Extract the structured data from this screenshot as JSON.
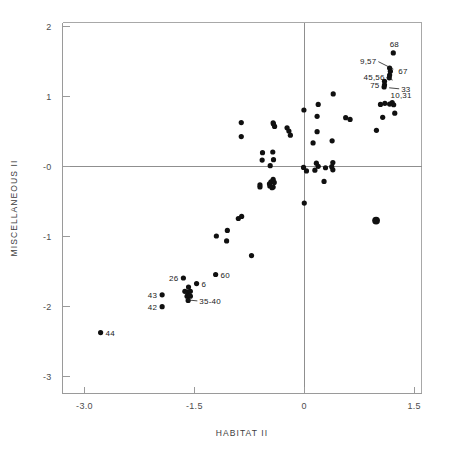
{
  "chart_data": {
    "type": "scatter",
    "title": "",
    "xlabel": "HABITAT  II",
    "ylabel": "MISCELLANEOUS  II",
    "xlim": [
      -3.3,
      1.6
    ],
    "ylim": [
      -3.25,
      2.05
    ],
    "xticks": [
      "-3.0",
      "-1.5",
      "0",
      "1.5"
    ],
    "xtick_values": [
      -3.0,
      -1.5,
      0,
      1.5
    ],
    "yticks": [
      "2",
      "1",
      "-0",
      "-1",
      "-2",
      "-3"
    ],
    "ytick_values": [
      2,
      1,
      0,
      -1,
      -2,
      -3
    ],
    "grid": false,
    "legend": "none",
    "zero_lines": {
      "x": 0,
      "y": 0
    },
    "marker_color": "#101010",
    "axis_color": "#9a9a9a",
    "points": [
      {
        "x": -2.78,
        "y": -2.38,
        "label": "44",
        "label_pos": "right",
        "size": 2.6
      },
      {
        "x": -1.94,
        "y": -1.84,
        "label": "43",
        "label_pos": "left",
        "size": 2.6
      },
      {
        "x": -1.94,
        "y": -2.01,
        "label": "42",
        "label_pos": "left",
        "size": 2.6
      },
      {
        "x": -1.65,
        "y": -1.6,
        "label": "26",
        "label_pos": "left",
        "size": 2.6
      },
      {
        "x": -1.47,
        "y": -1.68,
        "label": "6",
        "label_pos": "right",
        "size": 2.6
      },
      {
        "x": -1.21,
        "y": -1.55,
        "label": "60",
        "label_pos": "right",
        "size": 2.6
      },
      {
        "x": -1.58,
        "y": -1.73,
        "label": "",
        "label_pos": "",
        "size": 2.6
      },
      {
        "x": -1.63,
        "y": -1.79,
        "label": "",
        "label_pos": "",
        "size": 2.6
      },
      {
        "x": -1.59,
        "y": -1.8,
        "label": "",
        "label_pos": "",
        "size": 2.6
      },
      {
        "x": -1.555,
        "y": -1.79,
        "label": "",
        "label_pos": "",
        "size": 2.6
      },
      {
        "x": -1.6,
        "y": -1.86,
        "label": "",
        "label_pos": "",
        "size": 2.6
      },
      {
        "x": -1.555,
        "y": -1.86,
        "label": "",
        "label_pos": "",
        "size": 2.6
      },
      {
        "x": -1.585,
        "y": -1.92,
        "label": "",
        "label_pos": "",
        "size": 2.6
      },
      {
        "x": -0.72,
        "y": -1.28,
        "label": "",
        "label_pos": "",
        "size": 2.6
      },
      {
        "x": -1.2,
        "y": -1.0,
        "label": "",
        "label_pos": "",
        "size": 2.6
      },
      {
        "x": -1.05,
        "y": -0.92,
        "label": "",
        "label_pos": "",
        "size": 2.6
      },
      {
        "x": -1.06,
        "y": -1.07,
        "label": "",
        "label_pos": "",
        "size": 2.6
      },
      {
        "x": -0.9,
        "y": -0.75,
        "label": "",
        "label_pos": "",
        "size": 2.6
      },
      {
        "x": -0.855,
        "y": -0.72,
        "label": "",
        "label_pos": "",
        "size": 2.6
      },
      {
        "x": 0.0,
        "y": -0.53,
        "label": "",
        "label_pos": "",
        "size": 2.6
      },
      {
        "x": 0.98,
        "y": -0.78,
        "label": "",
        "label_pos": "",
        "size": 3.9
      },
      {
        "x": -0.605,
        "y": -0.27,
        "label": "",
        "label_pos": "",
        "size": 2.6
      },
      {
        "x": -0.605,
        "y": -0.3,
        "label": "",
        "label_pos": "",
        "size": 2.6
      },
      {
        "x": -0.475,
        "y": -0.255,
        "label": "",
        "label_pos": "",
        "size": 2.6
      },
      {
        "x": -0.47,
        "y": -0.285,
        "label": "",
        "label_pos": "",
        "size": 2.6
      },
      {
        "x": -0.455,
        "y": -0.225,
        "label": "",
        "label_pos": "",
        "size": 2.6
      },
      {
        "x": -0.44,
        "y": -0.31,
        "label": "",
        "label_pos": "",
        "size": 2.6
      },
      {
        "x": -0.425,
        "y": -0.19,
        "label": "",
        "label_pos": "",
        "size": 2.6
      },
      {
        "x": -0.41,
        "y": -0.235,
        "label": "",
        "label_pos": "",
        "size": 2.6
      },
      {
        "x": -0.425,
        "y": -0.3,
        "label": "",
        "label_pos": "",
        "size": 2.6
      },
      {
        "x": -0.465,
        "y": 0.005,
        "label": "",
        "label_pos": "",
        "size": 2.6
      },
      {
        "x": -0.575,
        "y": 0.085,
        "label": "",
        "label_pos": "",
        "size": 2.6
      },
      {
        "x": -0.42,
        "y": 0.09,
        "label": "",
        "label_pos": "",
        "size": 2.6
      },
      {
        "x": -0.57,
        "y": 0.19,
        "label": "",
        "label_pos": "",
        "size": 2.6
      },
      {
        "x": -0.43,
        "y": 0.2,
        "label": "",
        "label_pos": "",
        "size": 2.6
      },
      {
        "x": -0.42,
        "y": 0.6,
        "label": "",
        "label_pos": "",
        "size": 2.6
      },
      {
        "x": -0.405,
        "y": 0.565,
        "label": "",
        "label_pos": "",
        "size": 2.6
      },
      {
        "x": -0.425,
        "y": 0.615,
        "label": "",
        "label_pos": "",
        "size": 2.6
      },
      {
        "x": -0.86,
        "y": 0.62,
        "label": "",
        "label_pos": "",
        "size": 2.6
      },
      {
        "x": -0.86,
        "y": 0.42,
        "label": "",
        "label_pos": "",
        "size": 2.6
      },
      {
        "x": -0.235,
        "y": 0.545,
        "label": "",
        "label_pos": "",
        "size": 2.6
      },
      {
        "x": -0.21,
        "y": 0.5,
        "label": "",
        "label_pos": "",
        "size": 2.6
      },
      {
        "x": -0.19,
        "y": 0.44,
        "label": "",
        "label_pos": "",
        "size": 2.6
      },
      {
        "x": -0.005,
        "y": 0.8,
        "label": "",
        "label_pos": "",
        "size": 2.6
      },
      {
        "x": -0.01,
        "y": -0.02,
        "label": "",
        "label_pos": "",
        "size": 2.6
      },
      {
        "x": 0.03,
        "y": -0.07,
        "label": "",
        "label_pos": "",
        "size": 2.6
      },
      {
        "x": 0.12,
        "y": 0.33,
        "label": "",
        "label_pos": "",
        "size": 2.6
      },
      {
        "x": 0.19,
        "y": 0.88,
        "label": "",
        "label_pos": "",
        "size": 2.6
      },
      {
        "x": 0.175,
        "y": 0.71,
        "label": "",
        "label_pos": "",
        "size": 2.6
      },
      {
        "x": 0.175,
        "y": 0.49,
        "label": "",
        "label_pos": "",
        "size": 2.6
      },
      {
        "x": 0.165,
        "y": 0.04,
        "label": "",
        "label_pos": "",
        "size": 2.6
      },
      {
        "x": 0.19,
        "y": -0.005,
        "label": "",
        "label_pos": "",
        "size": 2.6
      },
      {
        "x": 0.145,
        "y": -0.06,
        "label": "",
        "label_pos": "",
        "size": 2.6
      },
      {
        "x": 0.27,
        "y": -0.22,
        "label": "",
        "label_pos": "",
        "size": 2.6
      },
      {
        "x": 0.29,
        "y": -0.025,
        "label": "",
        "label_pos": "",
        "size": 2.6
      },
      {
        "x": 0.395,
        "y": 1.03,
        "label": "",
        "label_pos": "",
        "size": 2.6
      },
      {
        "x": 0.38,
        "y": 0.36,
        "label": "",
        "label_pos": "",
        "size": 2.6
      },
      {
        "x": 0.39,
        "y": 0.05,
        "label": "",
        "label_pos": "",
        "size": 2.6
      },
      {
        "x": 0.375,
        "y": -0.01,
        "label": "",
        "label_pos": "",
        "size": 2.6
      },
      {
        "x": 0.39,
        "y": -0.055,
        "label": "",
        "label_pos": "",
        "size": 2.6
      },
      {
        "x": 0.565,
        "y": 0.69,
        "label": "",
        "label_pos": "",
        "size": 2.6
      },
      {
        "x": 0.625,
        "y": 0.665,
        "label": "",
        "label_pos": "",
        "size": 2.6
      },
      {
        "x": 0.985,
        "y": 0.51,
        "label": "",
        "label_pos": "",
        "size": 2.6
      },
      {
        "x": 1.04,
        "y": 0.88,
        "label": "",
        "label_pos": "",
        "size": 2.6
      },
      {
        "x": 1.07,
        "y": 0.695,
        "label": "",
        "label_pos": "",
        "size": 2.6
      },
      {
        "x": 1.1,
        "y": 0.895,
        "label": "",
        "label_pos": "",
        "size": 2.6
      },
      {
        "x": 1.165,
        "y": 0.885,
        "label": "",
        "label_pos": "",
        "size": 2.6
      },
      {
        "x": 1.2,
        "y": 0.905,
        "label": "",
        "label_pos": "",
        "size": 2.6
      },
      {
        "x": 1.22,
        "y": 0.875,
        "label": "",
        "label_pos": "",
        "size": 2.6
      },
      {
        "x": 1.235,
        "y": 0.755,
        "label": "",
        "label_pos": "",
        "size": 2.6
      },
      {
        "x": 1.09,
        "y": 1.13,
        "label": "",
        "label_pos": "",
        "size": 2.6
      },
      {
        "x": 1.095,
        "y": 1.16,
        "label": "",
        "label_pos": "",
        "size": 2.6
      },
      {
        "x": 1.095,
        "y": 1.21,
        "label": "",
        "label_pos": "",
        "size": 2.6
      },
      {
        "x": 1.16,
        "y": 1.26,
        "label": "",
        "label_pos": "",
        "size": 2.6
      },
      {
        "x": 1.165,
        "y": 1.3,
        "label": "",
        "label_pos": "",
        "size": 2.6
      },
      {
        "x": 1.175,
        "y": 1.355,
        "label": "",
        "label_pos": "",
        "size": 2.6
      },
      {
        "x": 1.165,
        "y": 1.4,
        "label": "",
        "label_pos": "",
        "size": 2.6
      },
      {
        "x": 1.215,
        "y": 1.615,
        "label": "",
        "label_pos": "",
        "size": 2.6
      }
    ],
    "callout_labels": [
      {
        "text": "68",
        "x": 1.215,
        "y": 1.615,
        "anchor": "above-right",
        "leader": false
      },
      {
        "text": "9,57",
        "x": 1.175,
        "y": 1.355,
        "anchor": "upper-left",
        "leader": true
      },
      {
        "text": "67",
        "x": 1.215,
        "y": 1.36,
        "anchor": "right",
        "leader": false
      },
      {
        "text": "45,56",
        "x": 1.165,
        "y": 1.27,
        "anchor": "left",
        "leader": true
      },
      {
        "text": "33",
        "x": 1.2,
        "y": 1.16,
        "anchor": "lower-right",
        "leader": true
      },
      {
        "text": "75",
        "x": 1.095,
        "y": 1.16,
        "anchor": "left",
        "leader": false
      },
      {
        "text": "10,31",
        "x": 1.11,
        "y": 1.02,
        "anchor": "right",
        "leader": false
      },
      {
        "text": "26",
        "x": -1.65,
        "y": -1.6,
        "anchor": "left",
        "leader": false
      },
      {
        "text": "6",
        "x": -1.47,
        "y": -1.68,
        "anchor": "right",
        "leader": false
      },
      {
        "text": "60",
        "x": -1.21,
        "y": -1.55,
        "anchor": "right",
        "leader": false
      },
      {
        "text": "43",
        "x": -1.94,
        "y": -1.84,
        "anchor": "left",
        "leader": false
      },
      {
        "text": "42",
        "x": -1.94,
        "y": -2.01,
        "anchor": "left",
        "leader": false
      },
      {
        "text": "35-40",
        "x": -1.555,
        "y": -1.87,
        "anchor": "lower-right",
        "leader": true
      },
      {
        "text": "44",
        "x": -2.78,
        "y": -2.38,
        "anchor": "right",
        "leader": false
      }
    ]
  }
}
